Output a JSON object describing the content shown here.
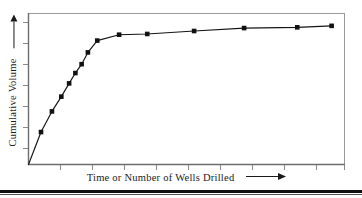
{
  "figure": {
    "background_color": "#ffffff",
    "frame_color": "#9a9a9a",
    "series_color": "#141414",
    "marker_color": "#111111",
    "text_color": "#1a1a1a"
  },
  "axes": {
    "y": {
      "label": "Cumulative Volume",
      "arrow": "up-arrow-icon",
      "tick_count": 7
    },
    "x": {
      "label": "Time or Number of Wells Drilled",
      "arrow": "right-arrow-icon",
      "tick_count": 10
    }
  },
  "chart_data": {
    "type": "line",
    "title": "",
    "subtitle": "",
    "xlabel": "Time or Number of Wells Drilled",
    "ylabel": "Cumulative Volume",
    "xlim": [
      0,
      100
    ],
    "ylim": [
      0,
      100
    ],
    "grid": false,
    "legend": null,
    "axis_ticks_labeled": false,
    "marker": "filled-square",
    "series": [
      {
        "name": "Cumulative Volume",
        "x": [
          0.0,
          4.0,
          7.5,
          10.5,
          13.0,
          15.0,
          17.0,
          19.0,
          22.0,
          29.0,
          38.0,
          53.0,
          69.0,
          86.0,
          97.0
        ],
        "values": [
          0.0,
          22.0,
          36.0,
          46.0,
          55.0,
          62.0,
          68.0,
          76.0,
          84.0,
          88.0,
          88.5,
          90.5,
          92.5,
          93.0,
          94.0
        ]
      }
    ],
    "annotations": [
      "Steep early rise followed by a flattening plateau (decline-curve shape)."
    ]
  }
}
